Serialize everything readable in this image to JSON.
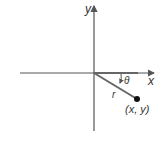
{
  "diagram": {
    "x_axis_label": "x",
    "y_axis_label": "y",
    "radius_label": "r",
    "angle_label": "θ",
    "point_label": "(x, y)",
    "colors": {
      "axis": "#555555",
      "ray": "#666666",
      "point": "#111111",
      "text": "#333333"
    }
  }
}
